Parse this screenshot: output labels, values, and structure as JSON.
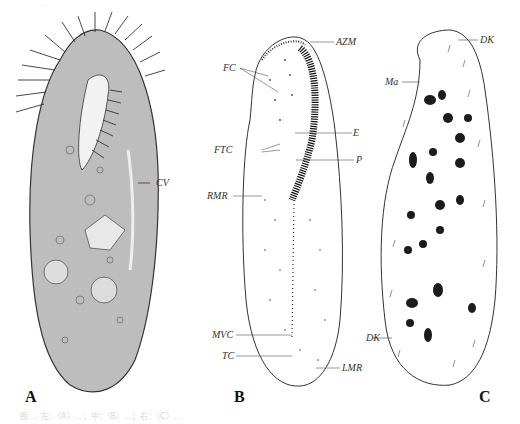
{
  "figure": {
    "top_text": "…",
    "caption": "图 … 左：（A）…；中：（B）…；右：（C）…",
    "panels": [
      {
        "letter": "A",
        "description": "Whole-cell illustration of a ciliate, dense cilia, cytoplasmic inclusions",
        "labels": [
          "CV"
        ]
      },
      {
        "letter": "B",
        "description": "Infraciliature diagram, ventral view",
        "labels": [
          "FC",
          "AZM",
          "E",
          "FTC",
          "P",
          "RMR",
          "MVC",
          "TC",
          "LMR"
        ]
      },
      {
        "letter": "C",
        "description": "Dorsal view showing macronuclear nodules and dorsal kineties",
        "labels": [
          "DK",
          "Ma",
          "DK"
        ]
      }
    ]
  }
}
